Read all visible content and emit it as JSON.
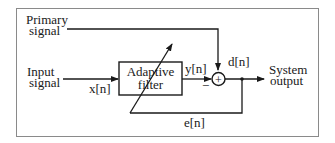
{
  "diagram": {
    "nodes": {
      "primary_signal": {
        "line1": "Primary",
        "line2": "signal"
      },
      "input_signal": {
        "line1": "Input",
        "line2": "signal"
      },
      "adaptive_filter": {
        "line1": "Adaptive",
        "line2": "filter"
      },
      "summer": {
        "symbol": "+"
      },
      "system_output": {
        "line1": "System",
        "line2": "output"
      }
    },
    "edge_labels": {
      "x": "x[n]",
      "y": "y[n]",
      "d": "d[n]",
      "e": "e[n]",
      "minus": "−"
    },
    "colors": {
      "ink": "#1a1a1a",
      "frame": "#8a8a8a",
      "background": "#ffffff"
    }
  }
}
